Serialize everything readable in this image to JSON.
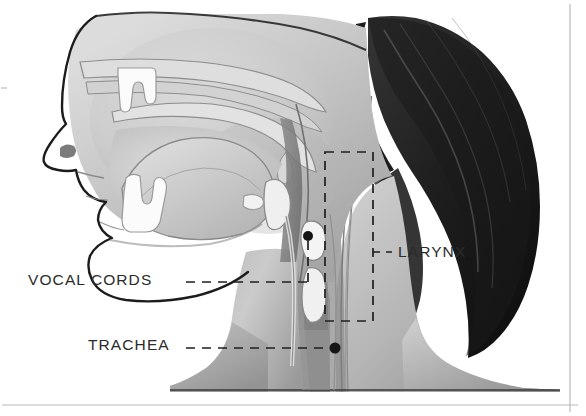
{
  "figure": {
    "type": "anatomical-illustration",
    "view": "left lateral sagittal cross-section",
    "style": "grayscale airbrush medical illustration",
    "width": 586,
    "height": 416
  },
  "labels": [
    {
      "id": "vocal-cords",
      "text": "VOCAL CORDS",
      "text_x": 28,
      "text_y": 272,
      "leader": {
        "type": "dashed-elbow",
        "horizontal_y": 282,
        "x_start": 186,
        "x_end": 308,
        "vertical_x": 308,
        "y_end": 240,
        "marker": "dot",
        "marker_x": 308,
        "marker_y": 236
      }
    },
    {
      "id": "trachea",
      "text": "TRACHEA",
      "text_x": 88,
      "text_y": 337,
      "leader": {
        "type": "dashed-straight",
        "horizontal_y": 348,
        "x_start": 186,
        "x_end": 333,
        "marker": "dot",
        "marker_x": 335,
        "marker_y": 348
      }
    },
    {
      "id": "larynx",
      "text": "LARYNX",
      "text_x": 398,
      "text_y": 244,
      "leader": {
        "type": "dashed-box-callout",
        "box_x": 325,
        "box_y": 152,
        "box_width": 48,
        "box_height": 169,
        "tick_y": 252,
        "tick_x_start": 373,
        "tick_x_end": 392
      }
    }
  ],
  "anatomy_regions": [
    "forehead",
    "nose",
    "upper lip",
    "lower lip",
    "upper teeth",
    "lower teeth",
    "mandible",
    "hard palate",
    "soft palate",
    "uvula",
    "nasal cavity",
    "oral cavity",
    "tongue",
    "pharynx",
    "epiglottis",
    "hyoid bone",
    "thyroid cartilage",
    "cricoid cartilage",
    "vocal cords",
    "larynx",
    "trachea",
    "esophagus",
    "neck",
    "shoulder",
    "hair",
    "ear region"
  ],
  "colors": {
    "background": "#ffffff",
    "outline": "#1f1f1f",
    "skin_light": "#e6e6e6",
    "skin_mid": "#c9c9c9",
    "skin_dark": "#9d9d9d",
    "cavity_shadow": "#8f8f8f",
    "cartilage_white": "#f7f7f7",
    "hair_dark": "#262626",
    "hair_shadow": "#141414",
    "label_text": "#2b2b2b",
    "dash_line": "#1f1f1f",
    "frame_rule": "#b9b9b9"
  },
  "frame": {
    "bottom_rule_y": 405,
    "right_rule_x": 570,
    "left_tick_y": 88,
    "visible": true
  }
}
